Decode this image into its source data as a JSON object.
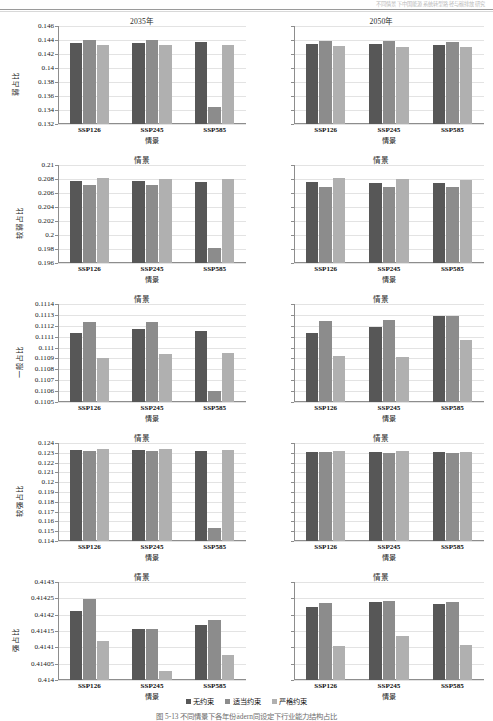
{
  "header": {
    "running_head": "不同情景下中国能源系统转型路径与碳排放研究",
    "page_number": "115"
  },
  "legend": {
    "position": "bottom-center",
    "items": [
      {
        "label": "无约束",
        "color": "#575757"
      },
      {
        "label": "适当约束",
        "color": "#8c8c8c"
      },
      {
        "label": "严格约束",
        "color": "#b0b0b0"
      }
    ]
  },
  "caption": "图 5-13   不同情景下各年份ädern同设定下行业能力结构占比",
  "axis": {
    "xlabel": "情景",
    "categories": [
      "SSP126",
      "SSP245",
      "SSP585"
    ]
  },
  "chart_data": [
    {
      "type": "bar",
      "title": "2035年",
      "panel_row": 1,
      "panel_col": "left",
      "xlabel": "情景",
      "ylabel": "弱占比",
      "categories": [
        "SSP126",
        "SSP245",
        "SSP585"
      ],
      "ylim": [
        0.132,
        0.146
      ],
      "yticks": [
        "0.132",
        "0.134",
        "0.136",
        "0.138",
        "0.14",
        "0.142",
        "0.144",
        "0.146"
      ],
      "grid": true,
      "series": [
        {
          "name": "无约束",
          "values": [
            0.14355,
            0.14355,
            0.14365
          ]
        },
        {
          "name": "适当约束",
          "values": [
            0.14405,
            0.144,
            0.13445
          ]
        },
        {
          "name": "严格约束",
          "values": [
            0.14325,
            0.14335,
            0.14325
          ]
        }
      ]
    },
    {
      "type": "bar",
      "title": "2050年",
      "panel_row": 1,
      "panel_col": "right",
      "xlabel": "情景",
      "ylabel": "弱占比",
      "categories": [
        "SSP126",
        "SSP245",
        "SSP585"
      ],
      "ylim": [
        0.132,
        0.146
      ],
      "yticks": [
        "",
        "",
        "",
        "",
        "",
        "",
        "",
        ""
      ],
      "grid": true,
      "series": [
        {
          "name": "无约束",
          "values": [
            0.14345,
            0.1434,
            0.14325
          ]
        },
        {
          "name": "适当约束",
          "values": [
            0.14385,
            0.14385,
            0.14375
          ]
        },
        {
          "name": "严格约束",
          "values": [
            0.1431,
            0.14305,
            0.143
          ]
        }
      ]
    },
    {
      "type": "bar",
      "title": "情景",
      "panel_row": 2,
      "panel_col": "left",
      "xlabel": "情景",
      "ylabel": "较弱占比",
      "categories": [
        "SSP126",
        "SSP245",
        "SSP585"
      ],
      "ylim": [
        0.196,
        0.21
      ],
      "yticks": [
        "0.196",
        "0.198",
        "0.2",
        "0.202",
        "0.204",
        "0.206",
        "0.208",
        "0.21"
      ],
      "grid": true,
      "series": [
        {
          "name": "无约束",
          "values": [
            0.20775,
            0.2077,
            0.2076
          ]
        },
        {
          "name": "适当约束",
          "values": [
            0.2071,
            0.2071,
            0.1981
          ]
        },
        {
          "name": "严格约束",
          "values": [
            0.2082,
            0.20805,
            0.20805
          ]
        }
      ]
    },
    {
      "type": "bar",
      "title": "情景",
      "panel_row": 2,
      "panel_col": "right",
      "xlabel": "情景",
      "ylabel": "较弱占比",
      "categories": [
        "SSP126",
        "SSP245",
        "SSP585"
      ],
      "ylim": [
        0.196,
        0.21
      ],
      "yticks": [
        "",
        "",
        "",
        "",
        "",
        "",
        "",
        ""
      ],
      "grid": true,
      "series": [
        {
          "name": "无约束",
          "values": [
            0.2076,
            0.2075,
            0.2074
          ]
        },
        {
          "name": "适当约束",
          "values": [
            0.2069,
            0.20685,
            0.2068
          ]
        },
        {
          "name": "严格约束",
          "values": [
            0.2081,
            0.20795,
            0.20785
          ]
        }
      ]
    },
    {
      "type": "bar",
      "title": "情景",
      "panel_row": 3,
      "panel_col": "left",
      "xlabel": "情景",
      "ylabel": "一般占比",
      "categories": [
        "SSP126",
        "SSP245",
        "SSP585"
      ],
      "ylim": [
        0.1105,
        0.1114
      ],
      "yticks": [
        "0.1105",
        "0.1106",
        "0.1107",
        "0.1108",
        "0.1109",
        "0.111",
        "0.1111",
        "0.1112",
        "0.1113",
        "0.1114"
      ],
      "grid": true,
      "series": [
        {
          "name": "无约束",
          "values": [
            0.11113,
            0.111175,
            0.11115
          ]
        },
        {
          "name": "适当约束",
          "values": [
            0.111235,
            0.111232,
            0.110605
          ]
        },
        {
          "name": "严格约束",
          "values": [
            0.110905,
            0.110945,
            0.110948
          ]
        }
      ]
    },
    {
      "type": "bar",
      "title": "情景",
      "panel_row": 3,
      "panel_col": "right",
      "xlabel": "情景",
      "ylabel": "一般占比",
      "categories": [
        "SSP126",
        "SSP245",
        "SSP585"
      ],
      "ylim": [
        0.1105,
        0.1114
      ],
      "yticks": [
        "",
        "",
        "",
        "",
        "",
        "",
        "",
        "",
        "",
        ""
      ],
      "grid": true,
      "series": [
        {
          "name": "无约束",
          "values": [
            0.111135,
            0.11119,
            0.11129
          ]
        },
        {
          "name": "适当约束",
          "values": [
            0.111245,
            0.11125,
            0.11129
          ]
        },
        {
          "name": "严格约束",
          "values": [
            0.110925,
            0.110915,
            0.11107
          ]
        }
      ]
    },
    {
      "type": "bar",
      "title": "情景",
      "panel_row": 4,
      "panel_col": "left",
      "xlabel": "情景",
      "ylabel": "较强占比",
      "categories": [
        "SSP126",
        "SSP245",
        "SSP585"
      ],
      "ylim": [
        0.114,
        0.124
      ],
      "yticks": [
        "0.114",
        "0.115",
        "0.116",
        "0.117",
        "0.118",
        "0.119",
        "0.12",
        "0.121",
        "0.122",
        "0.123",
        "0.124"
      ],
      "grid": true,
      "series": [
        {
          "name": "无约束",
          "values": [
            0.1233,
            0.12327,
            0.1232
          ]
        },
        {
          "name": "适当约束",
          "values": [
            0.12322,
            0.12322,
            0.11537
          ]
        },
        {
          "name": "严格约束",
          "values": [
            0.12337,
            0.12338,
            0.1233
          ]
        }
      ]
    },
    {
      "type": "bar",
      "title": "情景",
      "panel_row": 4,
      "panel_col": "right",
      "xlabel": "情景",
      "ylabel": "较强占比",
      "categories": [
        "SSP126",
        "SSP245",
        "SSP585"
      ],
      "ylim": [
        0.114,
        0.124
      ],
      "yticks": [
        "",
        "",
        "",
        "",
        "",
        "",
        "",
        "",
        "",
        "",
        ""
      ],
      "grid": true,
      "series": [
        {
          "name": "无约束",
          "values": [
            0.12312,
            0.12305,
            0.12307
          ]
        },
        {
          "name": "适当约束",
          "values": [
            0.1231,
            0.12303,
            0.12298
          ]
        },
        {
          "name": "严格约束",
          "values": [
            0.12315,
            0.12314,
            0.1231
          ]
        }
      ]
    },
    {
      "type": "bar",
      "title": "情景",
      "panel_row": 5,
      "panel_col": "left",
      "xlabel": "情景",
      "ylabel": "强占比",
      "categories": [
        "SSP126",
        "SSP245",
        "SSP585"
      ],
      "ylim": [
        0.414,
        0.4143
      ],
      "yticks": [
        "0.414",
        "0.41405",
        "0.4141",
        "0.41415",
        "0.4142",
        "0.41425",
        "0.4143"
      ],
      "grid": true,
      "series": [
        {
          "name": "无约束",
          "values": [
            0.414212,
            0.414157,
            0.414167
          ]
        },
        {
          "name": "适当约束",
          "values": [
            0.414247,
            0.414157,
            0.414184
          ]
        },
        {
          "name": "严格约束",
          "values": [
            0.41412,
            0.414028,
            0.414076
          ]
        }
      ]
    },
    {
      "type": "bar",
      "title": "情景",
      "panel_row": 5,
      "panel_col": "right",
      "xlabel": "情景",
      "ylabel": "强占比",
      "categories": [
        "SSP126",
        "SSP245",
        "SSP585"
      ],
      "ylim": [
        0.414,
        0.4143
      ],
      "yticks": [
        "",
        "",
        "",
        "",
        "",
        "",
        ""
      ],
      "grid": true,
      "series": [
        {
          "name": "无约束",
          "values": [
            0.414224,
            0.41424,
            0.414234
          ]
        },
        {
          "name": "适当约束",
          "values": [
            0.414237,
            0.414241,
            0.414238
          ]
        },
        {
          "name": "严格约束",
          "values": [
            0.414104,
            0.414135,
            0.414108
          ]
        }
      ]
    }
  ]
}
